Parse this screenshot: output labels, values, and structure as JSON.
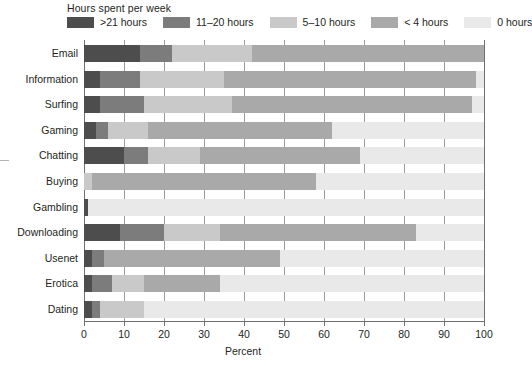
{
  "legend": {
    "title": "Hours spent per week",
    "items": [
      {
        "label": ">21 hours",
        "color": "#4d4d4d"
      },
      {
        "label": "11–20 hours",
        "color": "#7c7c7c"
      },
      {
        "label": "5–10 hours",
        "color": "#c9c9c9"
      },
      {
        "label": "< 4 hours",
        "color": "#a9a9a9"
      },
      {
        "label": "0 hours",
        "color": "#e9e9e9"
      }
    ]
  },
  "axes": {
    "xlabel": "Percent",
    "xticks": [
      0,
      10,
      20,
      30,
      40,
      50,
      60,
      70,
      80,
      90,
      100
    ],
    "xmin": 0,
    "xmax": 100
  },
  "chart_data": {
    "type": "bar",
    "title": "",
    "subtitle": "",
    "orientation": "horizontal",
    "stacked": true,
    "stack_total": 100,
    "xlabel": "Percent",
    "ylabel": "",
    "xlim": [
      0,
      100
    ],
    "grid": true,
    "legend_position": "top",
    "legend_title": "Hours spent per week",
    "categories": [
      "Email",
      "Information",
      "Surfing",
      "Gaming",
      "Chatting",
      "Buying",
      "Gambling",
      "Downloading",
      "Usenet",
      "Erotica",
      "Dating"
    ],
    "series": [
      {
        "name": ">21 hours",
        "color": "#4d4d4d",
        "values": [
          14,
          4,
          4,
          3,
          10,
          0,
          1,
          9,
          2,
          2,
          2
        ]
      },
      {
        "name": "11–20 hours",
        "color": "#7c7c7c",
        "values": [
          8,
          10,
          11,
          3,
          6,
          0,
          0,
          11,
          3,
          5,
          2
        ]
      },
      {
        "name": "5–10 hours",
        "color": "#c9c9c9",
        "values": [
          20,
          21,
          22,
          10,
          13,
          2,
          0,
          14,
          0,
          8,
          11
        ]
      },
      {
        "name": "< 4 hours",
        "color": "#a9a9a9",
        "values": [
          58,
          63,
          60,
          46,
          40,
          56,
          0,
          49,
          44,
          19,
          0
        ]
      },
      {
        "name": "0 hours",
        "color": "#e9e9e9",
        "values": [
          0,
          2,
          3,
          38,
          31,
          42,
          99,
          17,
          51,
          66,
          85
        ]
      }
    ]
  }
}
